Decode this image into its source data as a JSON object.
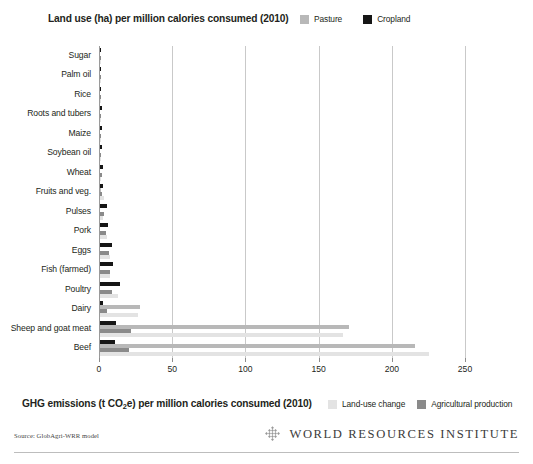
{
  "header": {
    "title": "Land use (ha) per million calories consumed (2010)",
    "legend": [
      {
        "label": "Pasture",
        "color": "#b8b8b8"
      },
      {
        "label": "Cropland",
        "color": "#161616"
      }
    ]
  },
  "footer": {
    "title_pre": "GHG emissions (t CO",
    "title_sub": "2",
    "title_post": "e) per million calories consumed (2010)",
    "title_full": "GHG emissions (t CO2e) per million calories consumed (2010)",
    "legend": [
      {
        "label": "Land-use change",
        "color": "#e3e3e3"
      },
      {
        "label": "Agricultural production",
        "color": "#8a8a8a"
      }
    ]
  },
  "source": {
    "text": "Source: GlobAgri-WRR model"
  },
  "logo": {
    "text": "WORLD RESOURCES INSTITUTE",
    "mark": "wri-diamond-icon"
  },
  "chart_data": {
    "type": "bar",
    "orientation": "horizontal",
    "title": "Land use (ha) per million calories consumed (2010)",
    "secondary_title": "GHG emissions (t CO2e) per million calories consumed (2010)",
    "xlabel": "",
    "ylabel": "",
    "xlim": [
      0,
      250
    ],
    "xticks": [
      0,
      50,
      100,
      150,
      200,
      250
    ],
    "ticklabels": [
      "0",
      "50",
      "100",
      "150",
      "200",
      "250"
    ],
    "grid": true,
    "legend_position": "top-right and bottom-right",
    "categories": [
      "Sugar",
      "Palm oil",
      "Rice",
      "Roots and tubers",
      "Maize",
      "Soybean oil",
      "Wheat",
      "Fruits and veg.",
      "Pulses",
      "Pork",
      "Eggs",
      "Fish (farmed)",
      "Poultry",
      "Dairy",
      "Sheep and goat meat",
      "Beef"
    ],
    "series": [
      {
        "name": "Cropland",
        "color": "#161616",
        "values": [
          1,
          1,
          1,
          1.5,
          1.5,
          1.5,
          2,
          2,
          4.5,
          5.5,
          8.5,
          9,
          13.5,
          2,
          11,
          10
        ]
      },
      {
        "name": "Pasture",
        "color": "#b8b8b8",
        "values": [
          0,
          0,
          0,
          0,
          0,
          0,
          0,
          0.5,
          0,
          0,
          0,
          0,
          0,
          27,
          170,
          215
        ]
      },
      {
        "name": "Agricultural production",
        "color": "#8a8a8a",
        "values": [
          1,
          1,
          1,
          1,
          1,
          1,
          1.5,
          1.5,
          3,
          4,
          6,
          7,
          8,
          4.5,
          21,
          20
        ]
      },
      {
        "name": "Land-use change",
        "color": "#e3e3e3",
        "values": [
          0.5,
          0.5,
          0.5,
          0.5,
          0.5,
          1,
          1,
          2.5,
          2,
          5,
          6.5,
          6.5,
          12,
          26,
          166,
          225
        ]
      }
    ]
  }
}
